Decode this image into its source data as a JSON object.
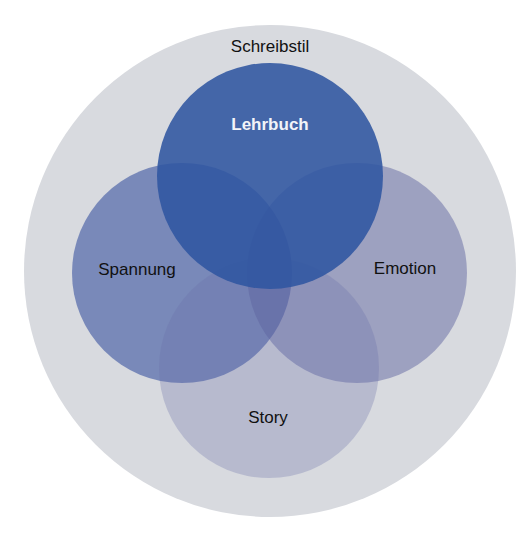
{
  "diagram": {
    "type": "venn",
    "outer": {
      "label": "Schreibstil",
      "color": "#d8dadf"
    },
    "sets": [
      {
        "id": "lehrbuch",
        "label": "Lehrbuch",
        "color": "#2f55a0",
        "opacity": 0.95,
        "label_color": "#f2f4f8"
      },
      {
        "id": "spannung",
        "label": "Spannung",
        "color": "#3a53a0",
        "opacity": 0.6
      },
      {
        "id": "emotion",
        "label": "Emotion",
        "color": "#565b9c",
        "opacity": 0.45
      },
      {
        "id": "story",
        "label": "Story",
        "color": "#6a70a8",
        "opacity": 0.3
      }
    ]
  }
}
